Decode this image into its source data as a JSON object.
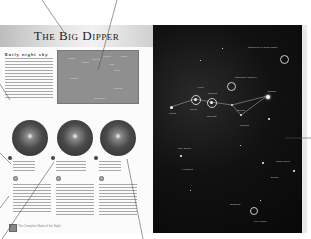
{
  "left_page": {
    "title": "The Big Dipper",
    "section_heading": "Early night sky",
    "sky_map_labels": [
      "Dubhe",
      "Merak",
      "Phecda",
      "Megrez",
      "Alioth",
      "Mizar",
      "Alkaid",
      "Polaris",
      "Arcturus",
      "Cor Caroli"
    ],
    "spheres": [
      {
        "id": "sphere-1",
        "caption_title": "M81",
        "caption_lines": 3
      },
      {
        "id": "sphere-2",
        "caption_title": "Whirlpool Galaxy",
        "caption_lines": 4
      },
      {
        "id": "sphere-3",
        "caption_title": "M101",
        "caption_lines": 3
      }
    ],
    "footer_text": "The Complete Book of the Night"
  },
  "right_page": {
    "star_labels": [
      {
        "text": "Galaxies in Ursa Major",
        "x": 255,
        "y": 55
      },
      {
        "text": "Mizar",
        "x": 197,
        "y": 91
      },
      {
        "text": "Alcor",
        "x": 205,
        "y": 86
      },
      {
        "text": "Whirlpool Galaxy",
        "x": 240,
        "y": 75
      },
      {
        "text": "Alkaid",
        "x": 172,
        "y": 111
      },
      {
        "text": "Megrez",
        "x": 214,
        "y": 93
      },
      {
        "text": "Phecda",
        "x": 200,
        "y": 114
      },
      {
        "text": "Merak",
        "x": 232,
        "y": 108
      },
      {
        "text": "Dubhe",
        "x": 262,
        "y": 90
      },
      {
        "text": "Polaris",
        "x": 240,
        "y": 126
      },
      {
        "text": "Cor Caroli",
        "x": 178,
        "y": 148
      },
      {
        "text": "Arcturus",
        "x": 182,
        "y": 169
      },
      {
        "text": "Ursa Minor",
        "x": 276,
        "y": 160
      },
      {
        "text": "Draco",
        "x": 274,
        "y": 175
      },
      {
        "text": "Regulus",
        "x": 235,
        "y": 204
      },
      {
        "text": "Leo Minor",
        "x": 254,
        "y": 221
      }
    ]
  }
}
